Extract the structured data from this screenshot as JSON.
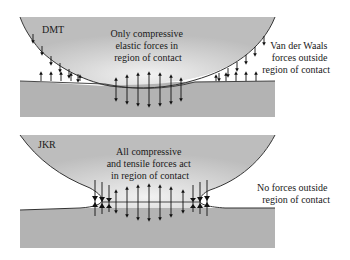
{
  "panels": [
    {
      "model": "DMT",
      "center_text": [
        "Only compressive",
        "elastic forces in",
        "region of contact"
      ],
      "side_text": [
        "Van der Waals",
        "forces outside",
        "region of contact"
      ]
    },
    {
      "model": "JKR",
      "center_text": [
        "All compressive",
        "and tensile forces act",
        "in region of contact"
      ],
      "side_text": [
        "No forces outside",
        "region of contact"
      ]
    }
  ],
  "colors": {
    "sphere": "#c8c8c8",
    "substrate": "#b0b0b0",
    "outline": "#333333",
    "arrow": "#111111"
  }
}
